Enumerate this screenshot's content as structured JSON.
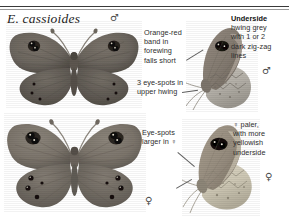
{
  "page": {
    "title": "E. cassioides",
    "background_color": "#ffffff",
    "rule_color": "#3a3a3a"
  },
  "symbols": {
    "male": "♂",
    "female": "♀"
  },
  "sex_markers": [
    {
      "name": "male-marker-upperside",
      "symbol": "♂",
      "x": 110,
      "y": 13
    },
    {
      "name": "male-marker-underside",
      "symbol": "♂",
      "x": 262,
      "y": 66
    },
    {
      "name": "female-marker-upperside",
      "symbol": "♀",
      "x": 145,
      "y": 196
    },
    {
      "name": "female-marker-underside",
      "symbol": "♀",
      "x": 265,
      "y": 172
    }
  ],
  "annotations": [
    {
      "name": "annotation-orange-red-band",
      "lines": [
        "Orange-red",
        "band in",
        "forewing",
        "falls short"
      ],
      "bold_prefix": ""
    },
    {
      "name": "annotation-three-eye-spots",
      "lines": [
        "3 eye-spots in",
        "upper hwing"
      ],
      "bold_prefix": ""
    },
    {
      "name": "annotation-underside-hwing",
      "lines": [
        "hwing grey",
        "with 1 or 2",
        "dark zig-zag",
        "lines"
      ],
      "bold_prefix": "Underside"
    },
    {
      "name": "annotation-eye-spots-larger",
      "lines": [
        "Eye-spots",
        "larger in ♀"
      ],
      "bold_prefix": ""
    },
    {
      "name": "annotation-female-paler",
      "lines": [
        "♀ paler,",
        "with more",
        "yellowish",
        "underside"
      ],
      "bold_prefix": ""
    }
  ],
  "specimens": [
    {
      "name": "male-upperside-specimen",
      "view": "upperside",
      "sex": "male",
      "wing_color": "#6b655e",
      "wing_color_dark": "#514c47",
      "spot_color": "#1a1613",
      "eye_spots_forewing": 2,
      "eye_spots_hindwing": 3
    },
    {
      "name": "female-upperside-specimen",
      "view": "upperside",
      "sex": "female",
      "wing_color": "#7d766d",
      "wing_color_dark": "#635d56",
      "spot_color": "#171310",
      "eye_spots_forewing": 2,
      "eye_spots_hindwing": 4
    },
    {
      "name": "male-underside-specimen",
      "view": "underside",
      "sex": "male",
      "forewing_color": "#8a8178",
      "hindwing_color": "#b8b4ac",
      "spot_color": "#17130f"
    },
    {
      "name": "female-underside-specimen",
      "view": "underside",
      "sex": "female",
      "forewing_color": "#9a9184",
      "hindwing_color": "#cfc9b6",
      "spot_color": "#17130f"
    }
  ]
}
